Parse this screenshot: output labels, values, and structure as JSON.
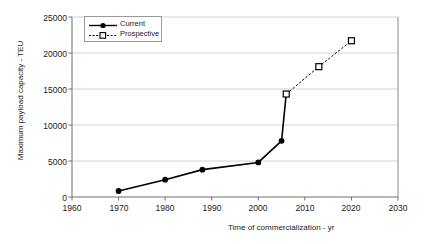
{
  "chart_data": {
    "type": "line",
    "title": "",
    "xlabel": "Time of commercialization - yr",
    "ylabel": "Maximum payload capacity - TEU",
    "xlim": [
      1960,
      2030
    ],
    "ylim": [
      0,
      25000
    ],
    "xticks": [
      "1960",
      "1970",
      "1980",
      "1990",
      "2000",
      "2010",
      "2020",
      "2030"
    ],
    "yticks": [
      "0",
      "5000",
      "10000",
      "15000",
      "20000",
      "25000"
    ],
    "grid": "horizontal",
    "legend_position": "top-left",
    "series": [
      {
        "name": "Current",
        "style": "solid",
        "marker": "filled-circle",
        "color": "#000000",
        "points": [
          {
            "x": 1970,
            "y": 830
          },
          {
            "x": 1980,
            "y": 2400
          },
          {
            "x": 1988,
            "y": 3800
          },
          {
            "x": 2000,
            "y": 4800
          },
          {
            "x": 2005,
            "y": 7800
          },
          {
            "x": 2006,
            "y": 14300
          }
        ]
      },
      {
        "name": "Prospective",
        "style": "dashed",
        "marker": "open-square",
        "color": "#000000",
        "points": [
          {
            "x": 2006,
            "y": 14300
          },
          {
            "x": 2013,
            "y": 18100
          },
          {
            "x": 2020,
            "y": 21700
          }
        ]
      }
    ]
  },
  "axes": {
    "x_title": "Time of commercialization - yr",
    "y_title": "Maximum payload capacity - TEU"
  },
  "legend": {
    "items": [
      {
        "label": "Current"
      },
      {
        "label": "Prospective"
      }
    ]
  },
  "colors": {
    "line": "#000000",
    "grid": "#c8c8c8",
    "axis": "#6e6e6e",
    "background": "#ffffff"
  }
}
